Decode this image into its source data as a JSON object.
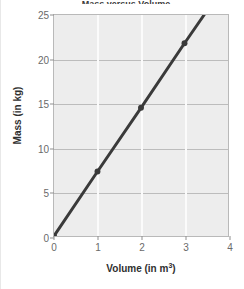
{
  "figure": {
    "background_color": "#ffffff",
    "title_cropped": "Mass versus Volume"
  },
  "chart_data": {
    "type": "line",
    "title": "",
    "xlabel_text": "Volume (in m",
    "xlabel_sup": "3",
    "xlabel_tail": ")",
    "xlabel": "Volume (in m3)",
    "ylabel": "Mass (in kg)",
    "x": [
      0,
      1,
      2,
      3
    ],
    "values": [
      0,
      7.3,
      14.5,
      21.8
    ],
    "series": [
      {
        "name": "Mass vs Volume",
        "x": [
          0,
          1,
          2,
          3
        ],
        "values": [
          0,
          7.3,
          14.5,
          21.8
        ]
      }
    ],
    "line_extends_to": {
      "x": 3.45,
      "y": 25.0
    },
    "slope": 7.25,
    "xlim": [
      0,
      4
    ],
    "ylim": [
      0,
      25
    ],
    "xticks": [
      0,
      1,
      2,
      3,
      4
    ],
    "xtick_labels": [
      "0",
      "1",
      "2",
      "3",
      "4"
    ],
    "yticks": [
      0,
      5,
      10,
      15,
      20,
      25
    ],
    "ytick_labels": [
      "0",
      "5",
      "10",
      "15",
      "20",
      "25"
    ],
    "grid": true,
    "grid_horizontal_color": "#bcbcbc",
    "grid_vertical_color": "#fbfbfb",
    "plot_background": "#ededed",
    "line_color": "#3a3a3a",
    "marker_color": "#3a3a3a",
    "line_width": 3,
    "marker_size": 5,
    "legend": null,
    "legend_position": "none"
  }
}
